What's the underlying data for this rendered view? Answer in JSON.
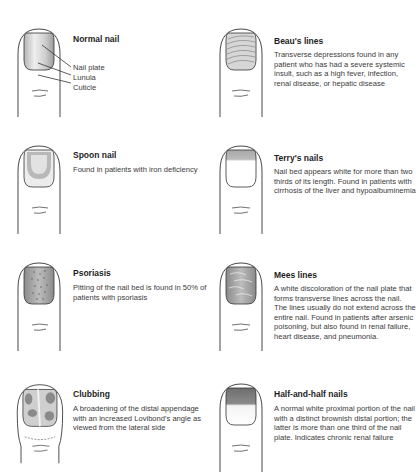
{
  "figure": {
    "items": [
      {
        "id": "normal-nail",
        "title": "Normal nail",
        "description": "",
        "labels": [
          "Nail plate",
          "Lunula",
          "Cuticle"
        ]
      },
      {
        "id": "beaus-lines",
        "title": "Beau's lines",
        "description": "Transverse depressions found in any patient who has had a severe systemic insult, such as a high fever, infection, renal disease, or hepatic disease"
      },
      {
        "id": "spoon-nail",
        "title": "Spoon nail",
        "description": "Found in patients with iron deficiency"
      },
      {
        "id": "terrys-nails",
        "title": "Terry's nails",
        "description": "Nail bed appears white for more than two thirds of its length. Found in patients with cirrhosis of the liver and hypoalbuminemia"
      },
      {
        "id": "psoriasis",
        "title": "Psoriasis",
        "description": "Pitting of the nail bed is found in 50% of patients with psoriasis"
      },
      {
        "id": "mees-lines",
        "title": "Mees lines",
        "description": "A white discoloration of the nail plate that forms transverse lines across the nail. The lines usually do not extend across the entire nail. Found in patients after arsenic poisoning, but also found in renal failure, heart disease, and pneumonia."
      },
      {
        "id": "clubbing",
        "title": "Clubbing",
        "description": "A broadening of the distal appendage with an increased Lovibond's angle as viewed from the lateral side"
      },
      {
        "id": "half-and-half-nails",
        "title": "Half-and-half nails",
        "description": "A normal white proximal portion of the nail with a distinct brownish distal portion; the latter is more than one third of the nail plate. Indicates chronic renal failure"
      }
    ]
  },
  "colors": {
    "outline": "#333333",
    "nail_shade": "#9a9a9a",
    "nail_light": "#e6e6e6"
  }
}
